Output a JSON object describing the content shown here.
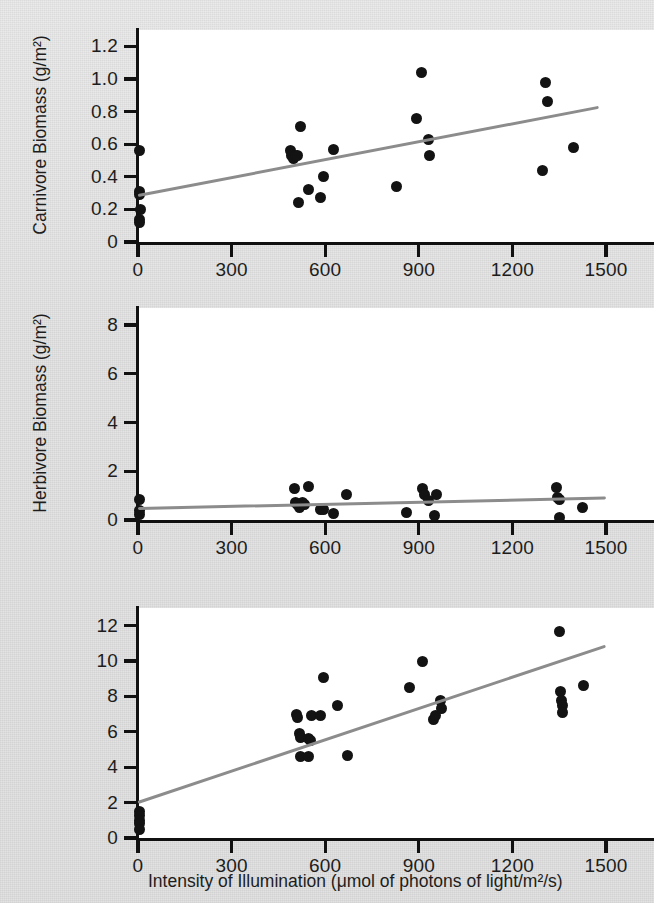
{
  "figure": {
    "xlabel": "Intensity of Illumination (μmol of photons of light/m²/s)",
    "line_color": "#8c8c8c",
    "point_color": "#131313",
    "plot_bg": "#ffffff",
    "page_bg": "#e4e4e4"
  },
  "chart_data": [
    {
      "type": "scatter",
      "title": "",
      "ylabel": "Carnivore Biomass (g/m²)",
      "xlabel": "Intensity of Illumination (μmol of photons of light/m²/s)",
      "xlim": [
        0,
        1570
      ],
      "ylim": [
        0,
        1.3
      ],
      "xticks": [
        0,
        300,
        600,
        900,
        1200,
        1500
      ],
      "xticklabels": [
        "0",
        "300",
        "600",
        "900",
        "1200",
        "1500"
      ],
      "yticks": [
        0,
        0.2,
        0.4,
        0.6,
        0.8,
        1.0,
        1.2
      ],
      "yticklabels": [
        "0",
        "0.2",
        "0.4",
        "0.6",
        "0.8",
        "1.0",
        "1.2"
      ],
      "grid": false,
      "legend": null,
      "points": [
        [
          5,
          0.56
        ],
        [
          5,
          0.31
        ],
        [
          5,
          0.29
        ],
        [
          8,
          0.2
        ],
        [
          5,
          0.14
        ],
        [
          5,
          0.12
        ],
        [
          488,
          0.56
        ],
        [
          492,
          0.53
        ],
        [
          498,
          0.51
        ],
        [
          505,
          0.53
        ],
        [
          512,
          0.53
        ],
        [
          515,
          0.24
        ],
        [
          520,
          0.71
        ],
        [
          548,
          0.32
        ],
        [
          585,
          0.27
        ],
        [
          595,
          0.4
        ],
        [
          628,
          0.57
        ],
        [
          828,
          0.34
        ],
        [
          893,
          0.76
        ],
        [
          908,
          1.04
        ],
        [
          930,
          0.63
        ],
        [
          935,
          0.53
        ],
        [
          1295,
          0.44
        ],
        [
          1305,
          0.98
        ],
        [
          1312,
          0.86
        ],
        [
          1395,
          0.58
        ]
      ],
      "trendline": {
        "x": [
          0,
          1475
        ],
        "y": [
          0.285,
          0.825
        ]
      }
    },
    {
      "type": "scatter",
      "title": "",
      "ylabel": "Herbivore Biomass (g/m²)",
      "xlabel": "Intensity of Illumination (μmol of photons of light/m²/s)",
      "xlim": [
        0,
        1570
      ],
      "ylim": [
        0,
        8.7
      ],
      "xticks": [
        0,
        300,
        600,
        900,
        1200,
        1500
      ],
      "xticklabels": [
        "0",
        "300",
        "600",
        "900",
        "1200",
        "1500"
      ],
      "yticks": [
        0,
        2,
        4,
        6,
        8
      ],
      "yticklabels": [
        "0",
        "2",
        "4",
        "6",
        "8"
      ],
      "grid": false,
      "legend": null,
      "points": [
        [
          5,
          0.85
        ],
        [
          5,
          0.4
        ],
        [
          5,
          0.22
        ],
        [
          500,
          1.3
        ],
        [
          505,
          0.7
        ],
        [
          512,
          0.62
        ],
        [
          518,
          0.52
        ],
        [
          528,
          0.72
        ],
        [
          535,
          0.62
        ],
        [
          545,
          1.38
        ],
        [
          585,
          0.45
        ],
        [
          595,
          0.42
        ],
        [
          628,
          0.25
        ],
        [
          668,
          1.05
        ],
        [
          862,
          0.32
        ],
        [
          912,
          1.3
        ],
        [
          918,
          1.05
        ],
        [
          930,
          0.82
        ],
        [
          950,
          0.18
        ],
        [
          958,
          1.05
        ],
        [
          1342,
          1.35
        ],
        [
          1345,
          0.92
        ],
        [
          1350,
          0.85
        ],
        [
          1352,
          0.12
        ],
        [
          1425,
          0.5
        ]
      ],
      "trendline": {
        "x": [
          0,
          1500
        ],
        "y": [
          0.45,
          0.88
        ]
      }
    },
    {
      "type": "scatter",
      "title": "",
      "ylabel": "Primary Producer Biomass (g algae/m²)",
      "ylabel_line1": "Primary Producer Biomass",
      "ylabel_line2": "(g algae/m²)",
      "xlabel": "Intensity of Illumination (μmol of photons of light/m²/s)",
      "xlim": [
        0,
        1570
      ],
      "ylim": [
        0,
        13.0
      ],
      "xticks": [
        0,
        300,
        600,
        900,
        1200,
        1500
      ],
      "xticklabels": [
        "0",
        "300",
        "600",
        "900",
        "1200",
        "1500"
      ],
      "yticks": [
        0,
        2,
        4,
        6,
        8,
        10,
        12
      ],
      "yticklabels": [
        "0",
        "2",
        "4",
        "6",
        "8",
        "10",
        "12"
      ],
      "grid": false,
      "legend": null,
      "points": [
        [
          5,
          1.5
        ],
        [
          5,
          1.3
        ],
        [
          5,
          1.0
        ],
        [
          5,
          0.8
        ],
        [
          5,
          0.5
        ],
        [
          508,
          7.0
        ],
        [
          512,
          6.8
        ],
        [
          518,
          5.9
        ],
        [
          522,
          5.7
        ],
        [
          520,
          4.6
        ],
        [
          545,
          4.6
        ],
        [
          548,
          5.6
        ],
        [
          552,
          5.5
        ],
        [
          555,
          6.9
        ],
        [
          585,
          6.9
        ],
        [
          595,
          9.1
        ],
        [
          640,
          7.5
        ],
        [
          672,
          4.65
        ],
        [
          870,
          8.5
        ],
        [
          912,
          9.95
        ],
        [
          948,
          6.7
        ],
        [
          952,
          6.9
        ],
        [
          968,
          7.8
        ],
        [
          972,
          7.3
        ],
        [
          1352,
          11.7
        ],
        [
          1355,
          8.3
        ],
        [
          1358,
          7.8
        ],
        [
          1360,
          7.5
        ],
        [
          1362,
          7.1
        ],
        [
          1428,
          8.6
        ]
      ],
      "trendline": {
        "x": [
          0,
          1500
        ],
        "y": [
          2.0,
          10.85
        ]
      }
    }
  ]
}
